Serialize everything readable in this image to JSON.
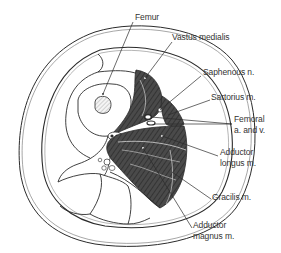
{
  "figure": {
    "colors": {
      "outline": "#2b2b2b",
      "muscle_fill": "#4a4a4a",
      "muscle_fiber": "#e8e8e8",
      "background": "#ffffff",
      "text": "#333333"
    }
  },
  "labels": {
    "femur": "Femur",
    "vastus_medialis": "Vastus medialis",
    "saphenous_nerve": "Saphenous n.",
    "sartorius": "Sartorius m.",
    "femoral_line1": "Femoral",
    "femoral_line2": "a. and v.",
    "adductor_longus_line1": "Adductor",
    "adductor_longus_line2": "longus m.",
    "gracilis": "Gracilis m.",
    "adductor_magnus_line1": "Adductor",
    "adductor_magnus_line2": "magnus m."
  }
}
